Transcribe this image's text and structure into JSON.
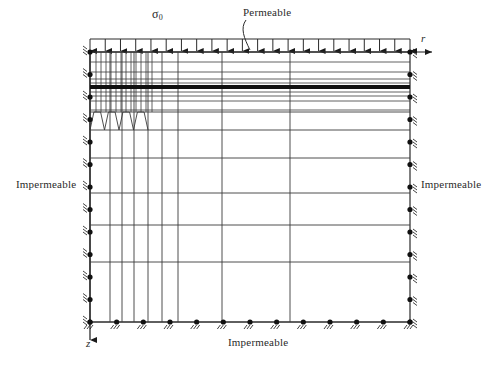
{
  "diagram": {
    "axes": {
      "horizontal_label": "r",
      "vertical_label": "z"
    },
    "load": {
      "symbol": "σ",
      "subscript": "0",
      "arrow_count": 22,
      "direction": "downward"
    },
    "boundary_labels": {
      "top": "Permeable",
      "left": "Impermeable",
      "right": "Impermeable",
      "bottom": "Impermeable"
    },
    "colors": {
      "line": "#2b2b2b",
      "mesh_line": "#3a3a3a",
      "thick_layer": "#111111",
      "background": "#ffffff",
      "support": "#111111"
    },
    "geometry": {
      "x_left": 90,
      "x_right": 410,
      "y_top": 52,
      "y_bottom": 322,
      "load_bar_y": 39,
      "axis_arrow_x": 424,
      "axis_arrow_y": 334
    },
    "mesh": {
      "vertical_lines_fine": [
        96,
        101,
        106,
        111,
        116,
        121,
        126,
        131,
        136,
        141,
        146,
        152
      ],
      "vertical_lines_coarse": [
        110,
        122,
        134,
        148,
        162,
        178,
        222,
        290
      ],
      "horizontal_lines_upper": [
        62,
        72,
        79,
        83,
        87,
        92,
        96,
        101,
        110
      ],
      "horizontal_lines_lower": [
        130,
        158,
        193,
        225,
        262,
        322
      ],
      "thick_layer_y": 87,
      "thick_layer_height": 4,
      "scallop_top_y": 112,
      "scallop_bottom_y": 130,
      "scallop_count": 4
    },
    "supports": {
      "left_count": 13,
      "right_count": 13,
      "bottom_count": 13,
      "type": "hatched-roller"
    }
  }
}
